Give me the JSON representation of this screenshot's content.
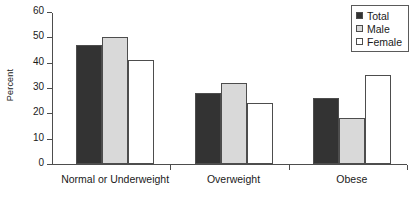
{
  "chart_data": {
    "type": "bar",
    "title": "",
    "xlabel": "",
    "ylabel": "Percent",
    "ylim": [
      0,
      60
    ],
    "ytick_step": 10,
    "yticks": [
      "60",
      "50",
      "40",
      "30",
      "20",
      "10",
      "0"
    ],
    "grid": false,
    "legend_position": "top-right",
    "categories": [
      "Normal or Underweight",
      "Overweight",
      "Obese"
    ],
    "series": [
      {
        "name": "Total",
        "values": [
          47,
          28,
          26
        ],
        "color": "#333333"
      },
      {
        "name": "Male",
        "values": [
          50,
          32,
          18
        ],
        "color": "#d9d9d9"
      },
      {
        "name": "Female",
        "values": [
          41,
          24,
          35
        ],
        "color": "#ffffff"
      }
    ]
  },
  "legend": {
    "items": [
      {
        "label": "Total"
      },
      {
        "label": "Male"
      },
      {
        "label": "Female"
      }
    ]
  },
  "colors": {
    "total": "#333333",
    "male": "#d9d9d9",
    "female": "#ffffff",
    "axis": "#4d4d4d",
    "text": "#1a1a1a"
  }
}
